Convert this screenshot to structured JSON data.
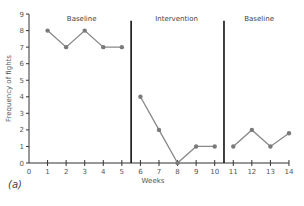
{
  "chart_data": {
    "type": "line",
    "title": "",
    "xlabel": "Weeks",
    "ylabel": "Frequency of fights",
    "xlim": [
      0,
      14
    ],
    "ylim": [
      0,
      9
    ],
    "x_ticks": [
      0,
      1,
      2,
      3,
      4,
      5,
      6,
      7,
      8,
      9,
      10,
      11,
      12,
      13,
      14
    ],
    "y_ticks": [
      0,
      1,
      2,
      3,
      4,
      5,
      6,
      7,
      8,
      9
    ],
    "grid": false,
    "legend": null,
    "phase_lines": [
      5.5,
      10.5
    ],
    "phases": [
      {
        "name": "Baseline",
        "x": [
          1,
          2,
          3,
          4,
          5
        ],
        "values": [
          8,
          7,
          8,
          7,
          7
        ]
      },
      {
        "name": "Intervention",
        "x": [
          6,
          7,
          8,
          9,
          10
        ],
        "values": [
          4,
          2,
          0,
          1,
          1
        ]
      },
      {
        "name": "Baseline",
        "x": [
          11,
          12,
          13,
          14
        ],
        "values": [
          1,
          2,
          1,
          1.8
        ]
      }
    ],
    "series_color": "#888888",
    "panel_label": "(a)"
  },
  "labels": {
    "panel": "(a)",
    "xlabel": "Weeks",
    "ylabel": "Frequency of fights",
    "phase1": "Baseline",
    "phase2": "Intervention",
    "phase3": "Baseline"
  }
}
